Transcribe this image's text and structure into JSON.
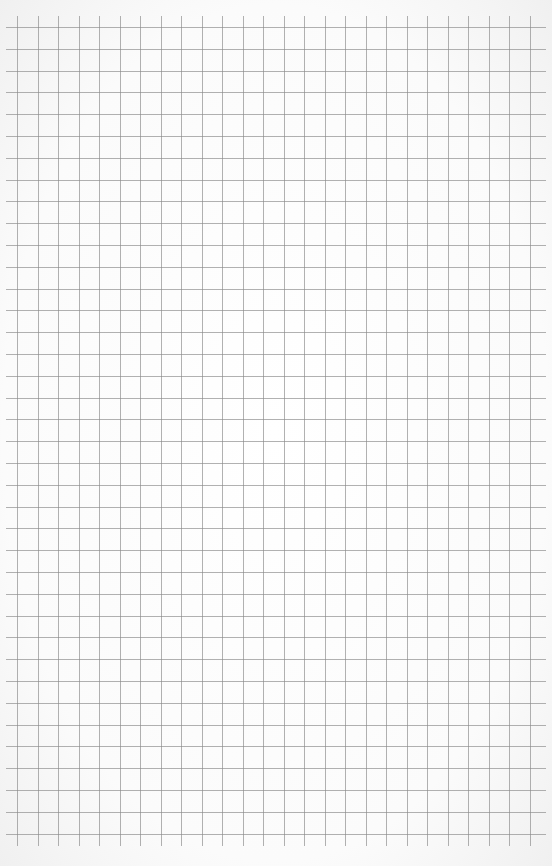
{
  "sheet": {
    "type": "graph-paper",
    "background_color": "#ffffff",
    "line_color": "#8a8a8a"
  },
  "grid": {
    "vertical_lines": {
      "count": 26,
      "start_x": 17,
      "spacing": 20.5,
      "top_y": 16,
      "bottom_y": 846
    },
    "horizontal_lines": {
      "count": 38,
      "start_y": 27,
      "spacing": 21.8,
      "left_x": 6,
      "right_x": 546
    }
  }
}
